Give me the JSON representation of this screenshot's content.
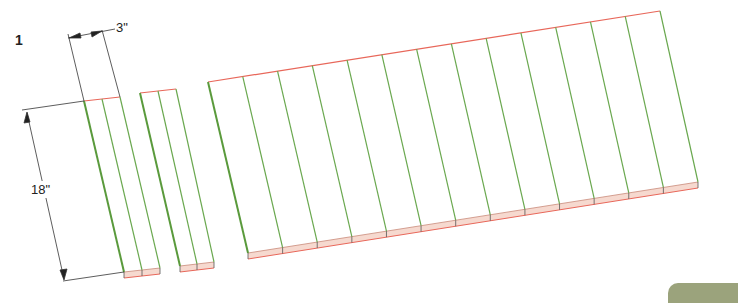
{
  "figure": {
    "step_number": "1",
    "dimensions": {
      "width_label": "3\"",
      "length_label": "18\""
    },
    "colors": {
      "board_edge": "#6aa84f",
      "end_grain_edge": "#e8675a",
      "end_grain_fill": "#f6d9cf",
      "dimension_line": "#333333",
      "tab": "#9ba37c"
    },
    "groups": [
      {
        "name": "pair-1",
        "boards": 2
      },
      {
        "name": "pair-2",
        "boards": 2
      },
      {
        "name": "panel",
        "boards": 13
      }
    ]
  }
}
